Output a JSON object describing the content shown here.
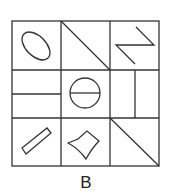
{
  "figure": {
    "label": "B",
    "grid": {
      "rows": 3,
      "cols": 3
    },
    "cells": [
      {
        "row": 0,
        "col": 0,
        "shape": "tilted ellipse"
      },
      {
        "row": 0,
        "col": 1,
        "shape": "diagonal line top-left to bottom-right"
      },
      {
        "row": 0,
        "col": 2,
        "shape": "Z-shaped zigzag"
      },
      {
        "row": 1,
        "col": 0,
        "shape": "horizontal line"
      },
      {
        "row": 1,
        "col": 1,
        "shape": "circle with horizontal diameter"
      },
      {
        "row": 1,
        "col": 2,
        "shape": "vertical line"
      },
      {
        "row": 2,
        "col": 0,
        "shape": "tilted rectangle"
      },
      {
        "row": 2,
        "col": 1,
        "shape": "bell/cup quadrilateral with curved side"
      },
      {
        "row": 2,
        "col": 2,
        "shape": "diagonal line top-left to bottom-right"
      }
    ],
    "stroke_color": "#333333"
  }
}
